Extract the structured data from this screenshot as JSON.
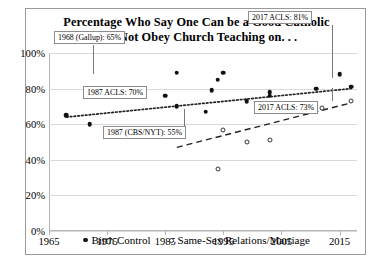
{
  "chart_data": {
    "type": "scatter",
    "title": "Percentage Who Say One Can be a Good Catholic and Not Obey Church Teaching on. . .",
    "title_line1": "Percentage Who Say One Can be a Good Catholic",
    "title_line2": "and Not Obey Church Teaching on. . .",
    "xlabel": "",
    "ylabel": "",
    "xlim": [
      1965,
      2018
    ],
    "ylim": [
      0,
      100
    ],
    "xticks": [
      1965,
      1975,
      1985,
      1995,
      2005,
      2015
    ],
    "xtick_labels": [
      "1965",
      "1975",
      "1985",
      "1995",
      "2005",
      "2015"
    ],
    "yticks": [
      0,
      20,
      40,
      60,
      80,
      100
    ],
    "ytick_labels": [
      "0%",
      "20%",
      "40%",
      "60%",
      "80%",
      "100%"
    ],
    "grid": true,
    "legend_position": "bottom",
    "series": [
      {
        "name": "Birth Control",
        "marker": "filled-circle",
        "trendline": "dotted",
        "points": [
          {
            "x": 1968,
            "y": 65
          },
          {
            "x": 1972,
            "y": 60
          },
          {
            "x": 1985,
            "y": 76
          },
          {
            "x": 1987,
            "y": 70
          },
          {
            "x": 1987,
            "y": 89
          },
          {
            "x": 1992,
            "y": 67
          },
          {
            "x": 1993,
            "y": 79
          },
          {
            "x": 1994,
            "y": 85
          },
          {
            "x": 1995,
            "y": 89
          },
          {
            "x": 1999,
            "y": 73
          },
          {
            "x": 2003,
            "y": 78
          },
          {
            "x": 2003,
            "y": 76
          },
          {
            "x": 2011,
            "y": 80
          },
          {
            "x": 2015,
            "y": 88
          },
          {
            "x": 2017,
            "y": 81
          }
        ],
        "trend_start": {
          "x": 1968,
          "y": 64
        },
        "trend_end": {
          "x": 2017,
          "y": 80
        }
      },
      {
        "name": "Same-Sex Relations/Marriage",
        "marker": "open-circle",
        "trendline": "dashed",
        "points": [
          {
            "x": 1987,
            "y": 55
          },
          {
            "x": 1994,
            "y": 35
          },
          {
            "x": 1995,
            "y": 57
          },
          {
            "x": 1999,
            "y": 50
          },
          {
            "x": 2003,
            "y": 51
          },
          {
            "x": 2012,
            "y": 69
          },
          {
            "x": 2017,
            "y": 73
          }
        ],
        "trend_start": {
          "x": 1987,
          "y": 47
        },
        "trend_end": {
          "x": 2017,
          "y": 72
        }
      }
    ],
    "annotations": [
      {
        "id": "gallup-1968",
        "label": "1968 (Gallup): 65%",
        "target": {
          "x": 1968,
          "y": 65
        }
      },
      {
        "id": "acls-1987",
        "label": "1987 ACLS: 70%",
        "target": {
          "x": 1987,
          "y": 70
        }
      },
      {
        "id": "cbsnyt-1987",
        "label": "1987 (CBS/NYT): 55%",
        "target": {
          "x": 1987,
          "y": 55
        }
      },
      {
        "id": "acls-2017-bc",
        "label": "2017 ACLS: 81%",
        "target": {
          "x": 2017,
          "y": 81
        }
      },
      {
        "id": "acls-2017-ss",
        "label": "2017 ACLS: 73%",
        "target": {
          "x": 2017,
          "y": 73
        }
      }
    ]
  },
  "colors": {
    "marker": "#111111",
    "grid": "#d9d9d9",
    "axis": "#b5b5b5",
    "callout_border": "#8c8c8c",
    "card_border": "#9a9a9a"
  }
}
